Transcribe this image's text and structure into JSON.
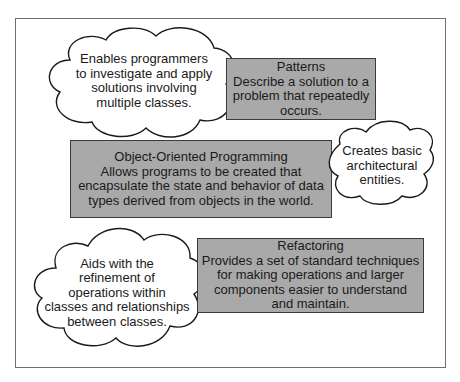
{
  "diagram": {
    "colors": {
      "box_fill": "#a9a9a9",
      "box_border": "#3a3a3a",
      "cloud_fill": "#ffffff",
      "cloud_stroke": "#1a1a1a",
      "frame_border": "#6e6e6e"
    },
    "boxes": {
      "patterns": {
        "title": "Patterns",
        "lines": [
          "Describe a solution to a",
          "problem that repeatedly",
          "occurs."
        ]
      },
      "oop": {
        "title": "Object-Oriented Programming",
        "lines": [
          "Allows programs to be created that",
          "encapsulate the state and behavior of data",
          "types derived from objects in the world."
        ]
      },
      "refactoring": {
        "title": "Refactoring",
        "lines": [
          "Provides a set of standard techniques",
          "for making operations and larger",
          "components easier to understand",
          "and maintain."
        ]
      }
    },
    "clouds": {
      "patterns_note": {
        "lines": [
          "Enables programmers",
          "to investigate and apply",
          "solutions involving",
          "multiple classes."
        ]
      },
      "oop_note": {
        "lines": [
          "Creates basic",
          "architectural",
          "entities."
        ]
      },
      "refactoring_note": {
        "lines": [
          "Aids with the",
          "refinement of",
          "operations within",
          "classes and relationships",
          "between classes."
        ]
      }
    }
  }
}
